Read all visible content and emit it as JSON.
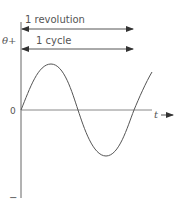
{
  "diagram": {
    "labels": {
      "revolution": "1 revolution",
      "cycle": "1 cycle",
      "theta_plus": "θ+",
      "origin": "0",
      "time_axis": "t",
      "minus": "−"
    },
    "colors": {
      "line": "#666666",
      "curve": "#555555",
      "text": "#555555",
      "background": "#ffffff"
    }
  }
}
